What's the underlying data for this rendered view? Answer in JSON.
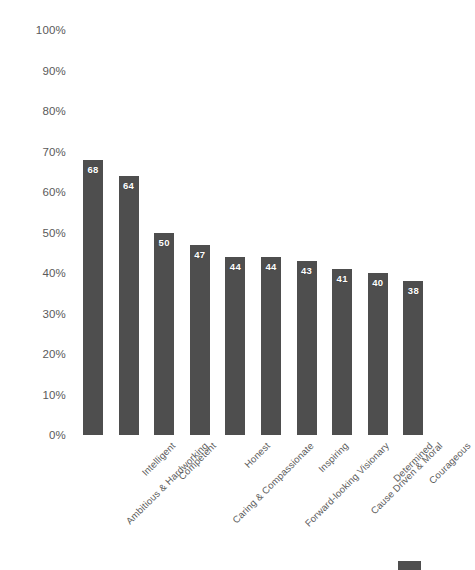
{
  "chart_data": {
    "type": "bar",
    "title": "",
    "subtitle": "",
    "xlabel": "",
    "ylabel": "",
    "ylim": [
      0,
      100
    ],
    "ytick_labels": [
      "100%",
      "90%",
      "80%",
      "70%",
      "60%",
      "50%",
      "40%",
      "30%",
      "20%",
      "10%",
      "0%"
    ],
    "ytick_values": [
      100,
      90,
      80,
      70,
      60,
      50,
      40,
      30,
      20,
      10,
      0
    ],
    "grid": false,
    "legend_position": "bottom-right",
    "bar_color": "#4e4e4e",
    "value_label_color": "#ffffff",
    "axis_text_color": "#5d5d5d",
    "categories": [
      "Ambitious & Hardworking",
      "Intelligent",
      "Competent",
      "Caring & Compassionate",
      "Honest",
      "Forward-looking Visionary",
      "Inspiring",
      "Cause Driven & Moral",
      "Determined",
      "Courageous"
    ],
    "values": [
      68,
      64,
      50,
      47,
      44,
      44,
      43,
      41,
      40,
      38
    ],
    "value_labels": [
      "68",
      "64",
      "50",
      "47",
      "44",
      "44",
      "43",
      "41",
      "40",
      "38"
    ],
    "series": [
      {
        "name": "",
        "values": [
          68,
          64,
          50,
          47,
          44,
          44,
          43,
          41,
          40,
          38
        ]
      }
    ]
  },
  "legend": {
    "swatch_color": "#4e4e4e",
    "label": ""
  }
}
